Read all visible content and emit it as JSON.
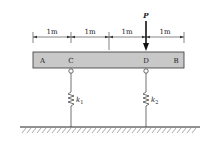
{
  "diagram": {
    "load": {
      "label": "P",
      "point": "D"
    },
    "dimensions": [
      "1m",
      "1m",
      "1m",
      "1m"
    ],
    "beam": {
      "points": [
        "A",
        "C",
        "D",
        "B"
      ],
      "fill": "#c8c8c8"
    },
    "springs": [
      {
        "base": "k",
        "sub": "1",
        "at": "C"
      },
      {
        "base": "k",
        "sub": "2",
        "at": "D"
      }
    ]
  }
}
